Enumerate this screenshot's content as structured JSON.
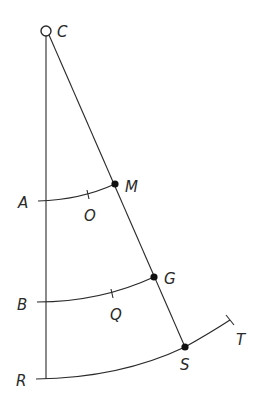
{
  "diagram": {
    "type": "geometric construction",
    "points": {
      "C": {
        "label": "C",
        "x": 46,
        "y": 31,
        "marker": "open-circle"
      },
      "M": {
        "label": "M",
        "x": 115,
        "y": 184,
        "marker": "filled-dot"
      },
      "G": {
        "label": "G",
        "x": 154,
        "y": 277,
        "marker": "filled-dot"
      },
      "S": {
        "label": "S",
        "x": 185,
        "y": 347,
        "marker": "filled-dot"
      },
      "A": {
        "label": "A",
        "x": 46,
        "y": 201
      },
      "B": {
        "label": "B",
        "x": 46,
        "y": 302
      },
      "R": {
        "label": "R",
        "x": 46,
        "y": 379
      },
      "O": {
        "label": "O"
      },
      "Q": {
        "label": "Q"
      },
      "T": {
        "label": "T"
      }
    },
    "labels": {
      "C": "C",
      "M": "M",
      "G": "G",
      "S": "S",
      "A": "A",
      "O": "O",
      "B": "B",
      "Q": "Q",
      "R": "R",
      "T": "T"
    },
    "segments": [
      {
        "from": "C",
        "to": "R",
        "kind": "vertical line"
      },
      {
        "from": "C",
        "to": "S",
        "kind": "slanted line through M and G"
      }
    ],
    "arcs": [
      {
        "from": "A",
        "to": "M",
        "midpoint_tick": "O"
      },
      {
        "from": "B",
        "to": "G",
        "midpoint_tick": "Q"
      },
      {
        "from": "R",
        "to": "T",
        "through": "S"
      }
    ]
  }
}
